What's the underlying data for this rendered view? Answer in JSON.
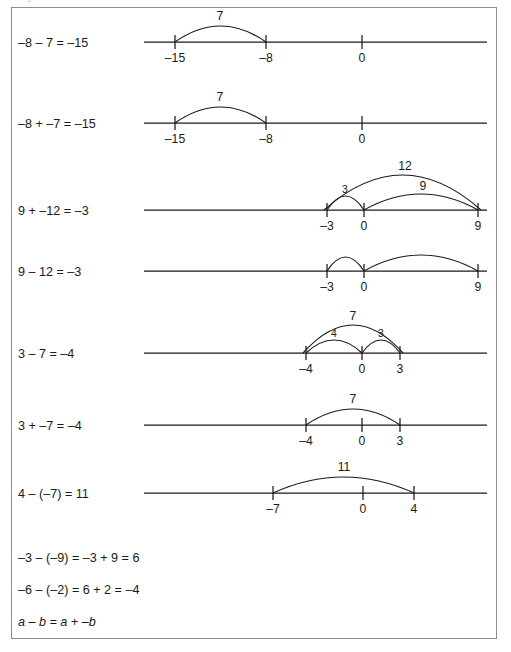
{
  "header": {
    "clipped_text": "integers.tiff"
  },
  "figure": {
    "border_color": "#8c8c8c",
    "ink_color": "#1a1a1a",
    "background": "#ffffff"
  },
  "rows": [
    {
      "id": "row-1",
      "equation": "–8 – 7 = –15",
      "equation_x": 18,
      "equation_y": 47,
      "line_y": 42,
      "line_x1": 144,
      "line_x2": 487,
      "ticks": [
        {
          "label": "–15",
          "x": 175
        },
        {
          "label": "–8",
          "x": 266
        },
        {
          "label": "0",
          "x": 362
        }
      ],
      "tick_label_y": 62,
      "arcs": [
        {
          "label": "7",
          "x1": 175,
          "x2": 266,
          "top": 26,
          "label_x": 220,
          "label_y": 20,
          "size": "normal"
        }
      ]
    },
    {
      "id": "row-2",
      "equation": "–8 + –7 = –15",
      "equation_x": 18,
      "equation_y": 128,
      "line_y": 123,
      "line_x1": 144,
      "line_x2": 487,
      "ticks": [
        {
          "label": "–15",
          "x": 175
        },
        {
          "label": "–8",
          "x": 266
        },
        {
          "label": "0",
          "x": 362
        }
      ],
      "tick_label_y": 143,
      "arcs": [
        {
          "label": "7",
          "x1": 175,
          "x2": 266,
          "top": 107,
          "label_x": 220,
          "label_y": 101,
          "size": "normal"
        }
      ]
    },
    {
      "id": "row-3",
      "equation": "9 + –12 = –3",
      "equation_x": 18,
      "equation_y": 215,
      "line_y": 210,
      "line_x1": 144,
      "line_x2": 487,
      "ticks": [
        {
          "label": "–3",
          "x": 327
        },
        {
          "label": "0",
          "x": 364
        },
        {
          "label": "9",
          "x": 478
        }
      ],
      "tick_label_y": 230,
      "arcs": [
        {
          "label": "12",
          "x1": 324,
          "x2": 481,
          "top": 175,
          "label_x": 405,
          "label_y": 170,
          "size": "normal"
        },
        {
          "label": "3",
          "x1": 327,
          "x2": 364,
          "top": 196,
          "label_x": 345,
          "label_y": 193,
          "size": "small"
        },
        {
          "label": "9",
          "x1": 364,
          "x2": 478,
          "top": 194,
          "label_x": 423,
          "label_y": 190,
          "size": "normal"
        }
      ]
    },
    {
      "id": "row-4",
      "equation": "9 – 12 = –3",
      "equation_x": 18,
      "equation_y": 276,
      "line_y": 271,
      "line_x1": 144,
      "line_x2": 487,
      "ticks": [
        {
          "label": "–3",
          "x": 327
        },
        {
          "label": "0",
          "x": 364
        },
        {
          "label": "9",
          "x": 478
        }
      ],
      "tick_label_y": 291,
      "arcs": [
        {
          "label": "",
          "x1": 327,
          "x2": 364,
          "top": 257,
          "label_x": 345,
          "label_y": 253,
          "size": "small"
        },
        {
          "label": "",
          "x1": 364,
          "x2": 478,
          "top": 255,
          "label_x": 423,
          "label_y": 251,
          "size": "normal"
        }
      ]
    },
    {
      "id": "row-5",
      "equation": "3 – 7 = –4",
      "equation_x": 18,
      "equation_y": 358,
      "line_y": 353,
      "line_x1": 144,
      "line_x2": 487,
      "ticks": [
        {
          "label": "–4",
          "x": 306
        },
        {
          "label": "0",
          "x": 362
        },
        {
          "label": "3",
          "x": 400
        }
      ],
      "tick_label_y": 373,
      "arcs": [
        {
          "label": "7",
          "x1": 303,
          "x2": 403,
          "top": 325,
          "label_x": 353,
          "label_y": 320,
          "size": "normal"
        },
        {
          "label": "4",
          "x1": 306,
          "x2": 362,
          "top": 340,
          "label_x": 334,
          "label_y": 337,
          "size": "small"
        },
        {
          "label": "3",
          "x1": 362,
          "x2": 400,
          "top": 340,
          "label_x": 381,
          "label_y": 337,
          "size": "small"
        }
      ]
    },
    {
      "id": "row-6",
      "equation": "3 + –7 = –4",
      "equation_x": 18,
      "equation_y": 430,
      "line_y": 425,
      "line_x1": 144,
      "line_x2": 487,
      "ticks": [
        {
          "label": "–4",
          "x": 306
        },
        {
          "label": "0",
          "x": 362
        },
        {
          "label": "3",
          "x": 400
        }
      ],
      "tick_label_y": 445,
      "arcs": [
        {
          "label": "7",
          "x1": 306,
          "x2": 400,
          "top": 409,
          "label_x": 353,
          "label_y": 403,
          "size": "normal"
        }
      ]
    },
    {
      "id": "row-7",
      "equation": "4 – (–7) = 11",
      "equation_x": 18,
      "equation_y": 498,
      "line_y": 493,
      "line_x1": 144,
      "line_x2": 487,
      "ticks": [
        {
          "label": "–7",
          "x": 273
        },
        {
          "label": "0",
          "x": 363
        },
        {
          "label": "4",
          "x": 414
        }
      ],
      "tick_label_y": 513,
      "arcs": [
        {
          "label": "11",
          "x1": 273,
          "x2": 414,
          "top": 477,
          "label_x": 344,
          "label_y": 471,
          "size": "normal"
        }
      ]
    }
  ],
  "footer_lines": [
    {
      "id": "footer-1",
      "text": "–3 – (–9) = –3 + 9 = 6",
      "x": 18,
      "y": 562,
      "italic": false
    },
    {
      "id": "footer-2",
      "text": "–6 – (–2) = 6 + 2 = –4",
      "x": 18,
      "y": 594,
      "italic": false
    },
    {
      "id": "footer-3",
      "text": "a – b = a + –b",
      "x": 18,
      "y": 626,
      "italic": true
    }
  ]
}
